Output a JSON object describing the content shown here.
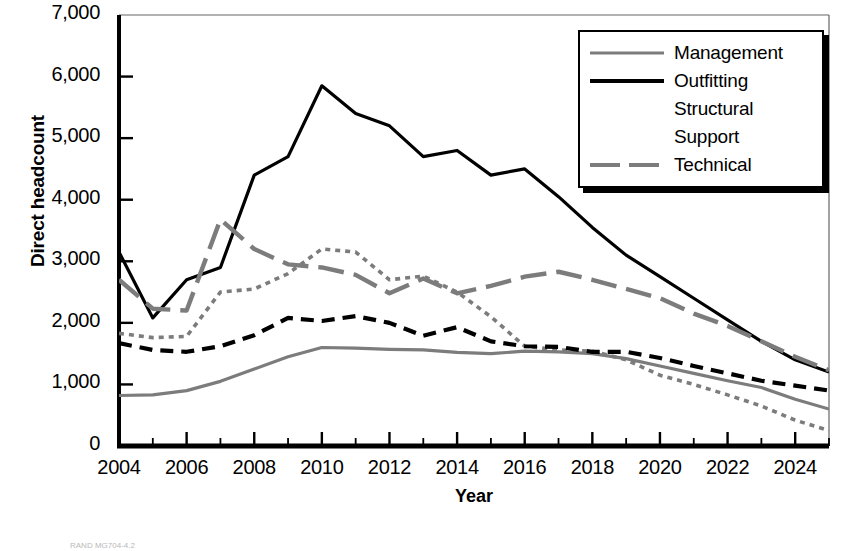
{
  "chart_data": {
    "type": "line",
    "title": "",
    "xlabel": "Year",
    "ylabel": "Direct headcount",
    "xlim": [
      2004,
      2025
    ],
    "ylim": [
      0,
      7000
    ],
    "xticks": [
      2004,
      2006,
      2008,
      2010,
      2012,
      2014,
      2016,
      2018,
      2020,
      2022,
      2024
    ],
    "xticklabels": [
      "2004",
      "2006",
      "2008",
      "2010",
      "2012",
      "2014",
      "2016",
      "2018",
      "2020",
      "2022",
      "2024"
    ],
    "yticks": [
      0,
      1000,
      2000,
      3000,
      4000,
      5000,
      6000,
      7000
    ],
    "yticklabels": [
      "0",
      "1,000",
      "2,000",
      "3,000",
      "4,000",
      "5,000",
      "6,000",
      "7,000"
    ],
    "minor_xticks": "every 1 year",
    "grid": false,
    "legend_position": "upper right",
    "x": [
      2004,
      2005,
      2006,
      2007,
      2008,
      2009,
      2010,
      2011,
      2012,
      2013,
      2014,
      2015,
      2016,
      2017,
      2018,
      2019,
      2020,
      2021,
      2022,
      2023,
      2024,
      2025
    ],
    "series": [
      {
        "name": "Management",
        "color": "#7c7c7c",
        "dash": "solid",
        "values": [
          820,
          830,
          900,
          1050,
          1250,
          1450,
          1600,
          1590,
          1570,
          1560,
          1520,
          1500,
          1540,
          1530,
          1500,
          1420,
          1300,
          1180,
          1060,
          950,
          760,
          600
        ]
      },
      {
        "name": "Outfitting",
        "color": "#000000",
        "dash": "solid",
        "values": [
          3150,
          2080,
          2700,
          2900,
          4400,
          4700,
          5850,
          5400,
          5200,
          4700,
          4800,
          4400,
          4500,
          4050,
          3550,
          3100,
          2750,
          2400,
          2050,
          1700,
          1400,
          1200
        ]
      },
      {
        "name": "Structural",
        "color": "#7c7c7c",
        "dash": "dotted",
        "values": [
          1830,
          1760,
          1780,
          2500,
          2550,
          2800,
          3200,
          3150,
          2700,
          2760,
          2500,
          2100,
          1620,
          1560,
          1540,
          1400,
          1150,
          1000,
          830,
          650,
          420,
          250
        ]
      },
      {
        "name": "Support",
        "color": "#000000",
        "dash": "dashed",
        "values": [
          1670,
          1560,
          1530,
          1620,
          1800,
          2080,
          2030,
          2110,
          2000,
          1790,
          1930,
          1700,
          1620,
          1610,
          1530,
          1530,
          1430,
          1300,
          1180,
          1060,
          980,
          900
        ]
      },
      {
        "name": "Technical",
        "color": "#7c7c7c",
        "dash": "longdash",
        "values": [
          2700,
          2230,
          2200,
          3680,
          3200,
          2950,
          2900,
          2780,
          2480,
          2720,
          2480,
          2600,
          2750,
          2830,
          2700,
          2550,
          2400,
          2150,
          1950,
          1700,
          1450,
          1230
        ]
      }
    ]
  },
  "legend": {
    "items": [
      {
        "label": "Management",
        "swatch": "solid-gray"
      },
      {
        "label": "Outfitting",
        "swatch": "solid-black"
      },
      {
        "label": "Structural",
        "swatch": "dotted-gray"
      },
      {
        "label": "Support",
        "swatch": "dashed-black"
      },
      {
        "label": "Technical",
        "swatch": "longdash-gray"
      }
    ]
  },
  "credit": "RAND MG704-4.2"
}
